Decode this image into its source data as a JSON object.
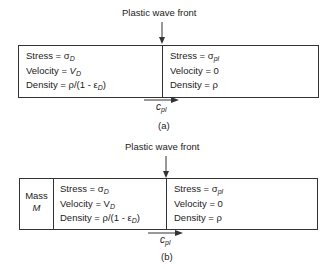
{
  "figures": [
    {
      "id": "a",
      "title": "Plastic wave front",
      "caption": "(a)",
      "mass_block": null,
      "deformed_region": {
        "stress_label": "Stress = ",
        "stress_symbol": "σ",
        "stress_sub": "D",
        "velocity_label": "Velocity = ",
        "velocity_symbol": "V",
        "velocity_sub": "D",
        "density_label": "Density = ρ/(1 - ε",
        "density_sub": "D",
        "density_end": ")"
      },
      "undeformed_region": {
        "stress_label": "Stress = ",
        "stress_symbol": "σ",
        "stress_sub": "pl",
        "velocity": "Velocity = 0",
        "density": "Density = ρ"
      },
      "wave_speed_symbol": "c",
      "wave_speed_sub": "pl"
    },
    {
      "id": "b",
      "title": "Plastic wave front",
      "caption": "(b)",
      "mass_block": {
        "line1": "Mass",
        "line2": "M"
      },
      "deformed_region": {
        "stress_label": "Stress = ",
        "stress_symbol": "σ",
        "stress_sub": "D",
        "velocity_label": "Velocity = V",
        "velocity_symbol": "",
        "velocity_sub": "D",
        "density_label": "Density = ρ/(1 - ε",
        "density_sub": "D",
        "density_end": ")"
      },
      "undeformed_region": {
        "stress_label": "Stress = ",
        "stress_symbol": "σ",
        "stress_sub": "pl",
        "velocity": "Velocity = 0",
        "density": "Density = ρ"
      },
      "wave_speed_symbol": "c",
      "wave_speed_sub": "pl"
    }
  ]
}
